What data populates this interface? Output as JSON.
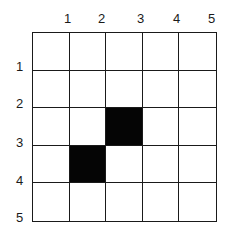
{
  "grid": {
    "rows": 5,
    "cols": 5,
    "column_labels": [
      "1",
      "2",
      "3",
      "4",
      "5"
    ],
    "row_labels": [
      "1",
      "2",
      "3",
      "4",
      "5"
    ],
    "filled_cells": [
      {
        "row": 3,
        "col": 3
      },
      {
        "row": 4,
        "col": 2
      }
    ],
    "colors": {
      "line": "#1a1a1a",
      "filled": "#050505",
      "empty": "#ffffff"
    }
  }
}
